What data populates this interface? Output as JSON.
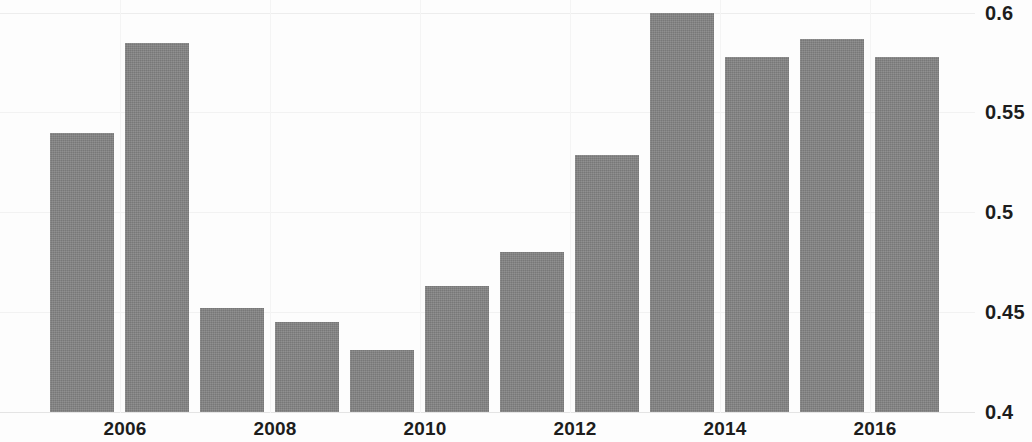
{
  "chart_data": {
    "type": "bar",
    "title": "",
    "subtitle": "",
    "xlabel": "",
    "ylabel": "",
    "categories": [
      "2005",
      "2006",
      "2007",
      "2008",
      "2009",
      "2010",
      "2011",
      "2012",
      "2013",
      "2014",
      "2015",
      "2016"
    ],
    "values": [
      0.54,
      0.585,
      0.452,
      0.445,
      0.431,
      0.463,
      0.48,
      0.529,
      0.6,
      0.578,
      0.587,
      0.578
    ],
    "series": [
      {
        "name": "",
        "values": [
          0.54,
          0.585,
          0.452,
          0.445,
          0.431,
          0.463,
          0.48,
          0.529,
          0.6,
          0.578,
          0.587,
          0.578
        ]
      }
    ],
    "ylim": [
      0.4,
      0.6
    ],
    "xlim": [
      "2005",
      "2016"
    ],
    "y_ticks": [
      0.4,
      0.45,
      0.5,
      0.55,
      0.6
    ],
    "y_tick_labels": [
      "0.4",
      "0.45",
      "0.5",
      "0.55",
      "0.6"
    ],
    "x_tick_labels": [
      "2006",
      "2008",
      "2010",
      "2012",
      "2014",
      "2016"
    ],
    "grid": true,
    "legend": false,
    "legend_position": "none",
    "y_axis_position": "right",
    "bar_color": "#838383",
    "background_color": "#fdfdfd",
    "gridline_color": "#ededed",
    "annotations": []
  },
  "axes": {
    "y_ticks": [
      {
        "label": "0.6",
        "value": 0.6
      },
      {
        "label": "0.55",
        "value": 0.55
      },
      {
        "label": "0.5",
        "value": 0.5
      },
      {
        "label": "0.45",
        "value": 0.45
      },
      {
        "label": "0.4",
        "value": 0.4
      }
    ],
    "x_ticks": [
      {
        "label": "2006",
        "value": 2006
      },
      {
        "label": "2008",
        "value": 2008
      },
      {
        "label": "2010",
        "value": 2010
      },
      {
        "label": "2012",
        "value": 2012
      },
      {
        "label": "2014",
        "value": 2014
      },
      {
        "label": "2016",
        "value": 2016
      }
    ]
  }
}
